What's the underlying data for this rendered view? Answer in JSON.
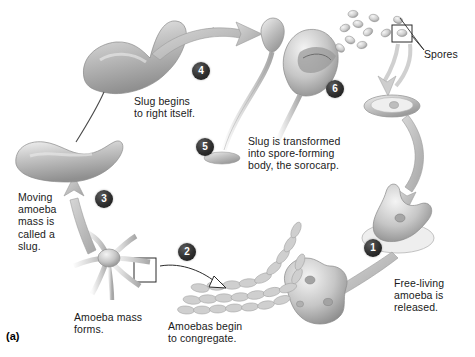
{
  "figure": {
    "label": "(a)",
    "background": "#ffffff",
    "ink": "#1a1a1a",
    "badge_fill": "#2e2e2e",
    "badge_text": "#ffffff",
    "art_fill_light": "#e9e9e9",
    "art_fill_mid": "#bdbdbd",
    "art_fill_dark": "#8e8e8e",
    "arrow_gray": "#b9b9b9",
    "line_black": "#2a2a2a"
  },
  "steps": [
    {
      "number": "1",
      "badge_x": 364,
      "badge_y": 239,
      "caption": "Free-living\namoeba is\nreleased.",
      "cap_x": 394,
      "cap_y": 277
    },
    {
      "number": "2",
      "badge_x": 178,
      "badge_y": 243,
      "caption": "Amoebas begin\nto congregate.",
      "cap_x": 168,
      "cap_y": 320
    },
    {
      "number": "3",
      "badge_x": 95,
      "badge_y": 190,
      "caption": "Moving\namoeba\nmass is\ncalled a\nslug.",
      "cap_x": 18,
      "cap_y": 191
    },
    {
      "number": "4",
      "badge_x": 192,
      "badge_y": 62,
      "caption": "Slug begins\nto right itself.",
      "cap_x": 134,
      "cap_y": 95
    },
    {
      "number": "5",
      "badge_x": 196,
      "badge_y": 138,
      "caption": "Slug is transformed\ninto spore-forming\nbody, the sorocarp.",
      "cap_x": 248,
      "cap_y": 135
    },
    {
      "number": "6",
      "badge_x": 326,
      "badge_y": 80,
      "caption": "",
      "cap_x": 0,
      "cap_y": 0
    }
  ],
  "annotations": [
    {
      "name": "spores-label",
      "text": "Spores",
      "x": 424,
      "y": 48
    },
    {
      "name": "amoeba-mass-label",
      "text": "Amoeba mass\nforms.",
      "x": 74,
      "y": 311
    }
  ]
}
